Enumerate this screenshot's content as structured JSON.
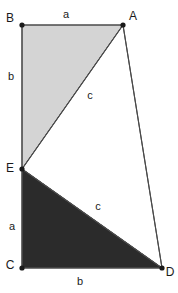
{
  "figure": {
    "canvas": {
      "width": 178,
      "height": 293
    },
    "colors": {
      "background": "#ffffff",
      "light_triangle_fill": "#d4d4d4",
      "dark_triangle_fill": "#2b2b2b",
      "middle_triangle_fill": "#ffffff",
      "stroke": "#4a4a4a",
      "vertex_dot": "#1a1a1a",
      "label_text": "#1a1a1a"
    },
    "vertices": [
      {
        "name": "B",
        "label": "B",
        "x": 22,
        "y": 25,
        "label_x": 10,
        "label_y": 18
      },
      {
        "name": "A",
        "label": "A",
        "x": 123,
        "y": 25,
        "label_x": 133,
        "label_y": 16
      },
      {
        "name": "E",
        "label": "E",
        "x": 22,
        "y": 169,
        "label_x": 10,
        "label_y": 168
      },
      {
        "name": "C",
        "label": "C",
        "x": 22,
        "y": 268,
        "label_x": 10,
        "label_y": 265
      },
      {
        "name": "D",
        "label": "D",
        "x": 162,
        "y": 268,
        "label_x": 170,
        "label_y": 272
      }
    ],
    "regions": [
      {
        "name": "upper-triangle-BAE",
        "points": "22,25 123,25 22,169",
        "fill": "#d4d4d4"
      },
      {
        "name": "middle-triangle-AED",
        "points": "123,25 22,169 162,268",
        "fill": "#ffffff"
      },
      {
        "name": "lower-triangle-ECD",
        "points": "22,169 22,268 162,268",
        "fill": "#2b2b2b"
      }
    ],
    "edges": [
      {
        "name": "edge-B-A",
        "x1": 22,
        "y1": 25,
        "x2": 123,
        "y2": 25
      },
      {
        "name": "edge-B-E",
        "x1": 22,
        "y1": 25,
        "x2": 22,
        "y2": 169
      },
      {
        "name": "edge-E-C",
        "x1": 22,
        "y1": 169,
        "x2": 22,
        "y2": 268
      },
      {
        "name": "edge-C-D",
        "x1": 22,
        "y1": 268,
        "x2": 162,
        "y2": 268
      },
      {
        "name": "edge-A-E",
        "x1": 123,
        "y1": 25,
        "x2": 22,
        "y2": 169
      },
      {
        "name": "edge-E-D",
        "x1": 22,
        "y1": 169,
        "x2": 162,
        "y2": 268
      },
      {
        "name": "edge-A-D",
        "x1": 123,
        "y1": 25,
        "x2": 162,
        "y2": 268
      }
    ],
    "side_labels": [
      {
        "name": "label-side-a-top",
        "text": "a",
        "x": 66,
        "y": 14
      },
      {
        "name": "label-side-b-left",
        "text": "b",
        "x": 11,
        "y": 76
      },
      {
        "name": "label-side-c-upper",
        "text": "c",
        "x": 90,
        "y": 95
      },
      {
        "name": "label-side-c-lower",
        "text": "c",
        "x": 98,
        "y": 206
      },
      {
        "name": "label-side-a-left",
        "text": "a",
        "x": 12,
        "y": 226
      },
      {
        "name": "label-side-b-bottom",
        "text": "b",
        "x": 80,
        "y": 281
      }
    ]
  }
}
